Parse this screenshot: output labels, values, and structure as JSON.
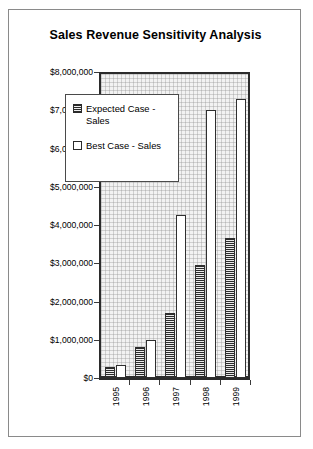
{
  "chart_data": {
    "type": "bar",
    "title": "Sales Revenue Sensitivity Analysis",
    "xlabel": "",
    "ylabel": "",
    "categories": [
      "1995",
      "1996",
      "1997",
      "1998",
      "1999"
    ],
    "series": [
      {
        "name": "Expected Case - Sales",
        "values": [
          300000,
          800000,
          1700000,
          2950000,
          3650000
        ]
      },
      {
        "name": "Best Case - Sales",
        "values": [
          350000,
          1000000,
          4250000,
          7000000,
          7300000
        ]
      }
    ],
    "ylim": [
      0,
      8000000
    ],
    "ytick_labels": [
      "$8,000,000",
      "$7,000,000",
      "$6,000,000",
      "$5,000,000",
      "$4,000,000",
      "$3,000,000",
      "$2,000,000",
      "$1,000,000",
      "$0"
    ],
    "ytick_values": [
      8000000,
      7000000,
      6000000,
      5000000,
      4000000,
      3000000,
      2000000,
      1000000,
      0
    ],
    "grid": true,
    "legend_position": "inside-upper-left",
    "colors": {
      "expected_fill": "#8f8f8f",
      "best_fill": "#ffffff",
      "bar_outline": "#2f2f2f",
      "axis": "#2b2b2b",
      "plot_background": "#f2f2f2",
      "card_border": "#8a8a8a",
      "text": "#000000"
    }
  },
  "legend": {
    "items": [
      {
        "label": "Expected Case - Sales",
        "key": "hatched-square-icon"
      },
      {
        "label": "Best Case - Sales",
        "key": "white-square-icon"
      }
    ]
  }
}
